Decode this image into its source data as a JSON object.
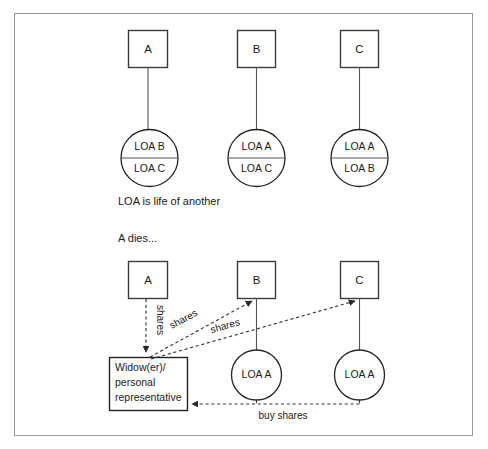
{
  "diagram": {
    "title_caption": "LOA is life of another",
    "event_caption": "A dies...",
    "top_section": {
      "nodes": [
        {
          "id": "A",
          "label": "A",
          "policy_top": "LOA B",
          "policy_bottom": "LOA C"
        },
        {
          "id": "B",
          "label": "B",
          "policy_top": "LOA A",
          "policy_bottom": "LOA C"
        },
        {
          "id": "C",
          "label": "C",
          "policy_top": "LOA A",
          "policy_bottom": "LOA B"
        }
      ]
    },
    "bottom_section": {
      "nodes": [
        {
          "id": "A",
          "label": "A",
          "policy": null
        },
        {
          "id": "B",
          "label": "B",
          "policy": "LOA A"
        },
        {
          "id": "C",
          "label": "C",
          "policy": "LOA A"
        }
      ],
      "estate_box": {
        "line1": "Widow(er)/",
        "line2": "personal",
        "line3": "representative"
      },
      "edges": [
        {
          "from": "A",
          "to": "estate",
          "label": "shares"
        },
        {
          "from": "estate",
          "to": "B",
          "label": "shares"
        },
        {
          "from": "estate",
          "to": "C",
          "label": "shares"
        },
        {
          "from": "B-and-C",
          "to": "estate",
          "label": "buy shares"
        }
      ]
    },
    "colors": {
      "frame_border": "#9a9a9a",
      "box_stroke": "#3c3c3c",
      "circle_stroke": "#222222",
      "dashed_stroke": "#3a3a3a",
      "text": "#1a1a1a",
      "background": "#ffffff"
    }
  }
}
